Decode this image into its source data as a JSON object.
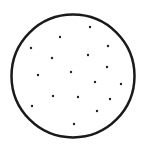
{
  "diagram": {
    "background": "#ffffff",
    "circle": {
      "cx": 73,
      "cy": 76,
      "r": 61.5,
      "stroke": "#1a1a1a",
      "stroke_width": 2.5,
      "fill": "#ffffff"
    },
    "dot_style": {
      "r": 1.2,
      "fill": "#222222"
    },
    "dot_count": 17,
    "dots": [
      {
        "x": 90,
        "y": 27
      },
      {
        "x": 60,
        "y": 37
      },
      {
        "x": 108,
        "y": 46
      },
      {
        "x": 31,
        "y": 48
      },
      {
        "x": 88,
        "y": 55
      },
      {
        "x": 52,
        "y": 58
      },
      {
        "x": 107,
        "y": 67
      },
      {
        "x": 71,
        "y": 72
      },
      {
        "x": 38,
        "y": 75
      },
      {
        "x": 95,
        "y": 82
      },
      {
        "x": 121,
        "y": 84
      },
      {
        "x": 53,
        "y": 96
      },
      {
        "x": 78,
        "y": 97
      },
      {
        "x": 110,
        "y": 99
      },
      {
        "x": 32,
        "y": 106
      },
      {
        "x": 97,
        "y": 111
      },
      {
        "x": 74,
        "y": 124
      }
    ]
  }
}
